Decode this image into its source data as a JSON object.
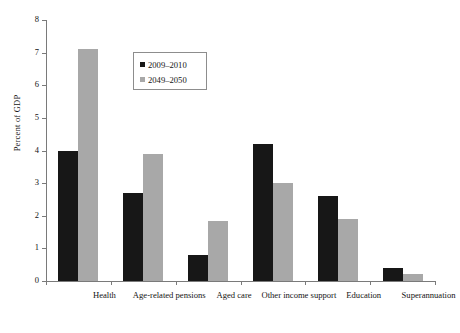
{
  "chart_data": {
    "type": "bar",
    "title": "",
    "xlabel": "",
    "ylabel": "Percent of GDP",
    "ylim": [
      0,
      8
    ],
    "yticks": [
      0,
      1,
      2,
      3,
      4,
      5,
      6,
      7,
      8
    ],
    "ytick_labels": [
      "0",
      "1",
      "2",
      "3",
      "4",
      "5",
      "6",
      "7",
      "8"
    ],
    "grid": false,
    "legend_position": "upper-center-left",
    "categories": [
      "Health",
      "Age-related pensions",
      "Aged care",
      "Other income support",
      "Education",
      "Superannuation"
    ],
    "series": [
      {
        "name": "2009–2010",
        "color": "#171717",
        "values": [
          4.0,
          2.7,
          0.8,
          4.2,
          2.6,
          0.4
        ]
      },
      {
        "name": "2049–2050",
        "color": "#a8a8a8",
        "values": [
          7.1,
          3.9,
          1.85,
          3.0,
          1.9,
          0.2
        ]
      }
    ]
  },
  "legend": {
    "entries": [
      {
        "label": "2009–2010",
        "color": "#171717"
      },
      {
        "label": "2049–2050",
        "color": "#a8a8a8"
      }
    ]
  },
  "axes": {
    "y_title": "Percent of GDP",
    "y_tick_labels": [
      "0",
      "1",
      "2",
      "3",
      "4",
      "5",
      "6",
      "7",
      "8"
    ],
    "x_tick_labels": [
      "Health",
      "Age-related pensions",
      "Aged care",
      "Other income support",
      "Education",
      "Superannuation"
    ]
  },
  "colors": {
    "series_1": "#171717",
    "series_2": "#a8a8a8",
    "axis": "#7a7a7a",
    "text": "#141414",
    "background": "#ffffff"
  }
}
